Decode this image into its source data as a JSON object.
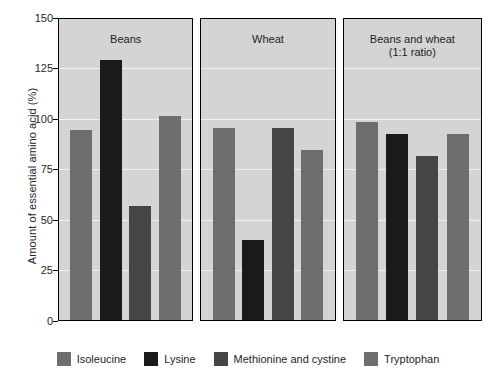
{
  "chart_data": {
    "type": "bar",
    "title": "",
    "xlabel": "",
    "ylabel": "Amount of essential amino acid (%)",
    "ylim": [
      0,
      150
    ],
    "yticks": [
      0,
      25,
      50,
      75,
      100,
      125,
      150
    ],
    "grid": true,
    "legend_position": "bottom",
    "panels": [
      "Beans",
      "Wheat",
      "Beans and wheat\n(1:1 ratio)"
    ],
    "categories": [
      "Beans",
      "Wheat",
      "Beans and wheat (1:1 ratio)"
    ],
    "series": [
      {
        "name": "Isoleucine",
        "color": "#6e6e6e",
        "values": [
          95,
          96,
          99
        ]
      },
      {
        "name": "Lysine",
        "color": "#1a1a1a",
        "values": [
          130,
          40,
          93
        ]
      },
      {
        "name": "Methionine and cystine",
        "color": "#454545",
        "values": [
          57,
          96,
          82
        ]
      },
      {
        "name": "Tryptophan",
        "color": "#6e6e6e",
        "values": [
          102,
          85,
          93
        ]
      }
    ]
  },
  "legend": {
    "items": [
      {
        "label": "Isoleucine",
        "color": "#6e6e6e"
      },
      {
        "label": "Lysine",
        "color": "#1a1a1a"
      },
      {
        "label": "Methionine and cystine",
        "color": "#454545"
      },
      {
        "label": "Tryptophan",
        "color": "#6e6e6e"
      }
    ]
  }
}
